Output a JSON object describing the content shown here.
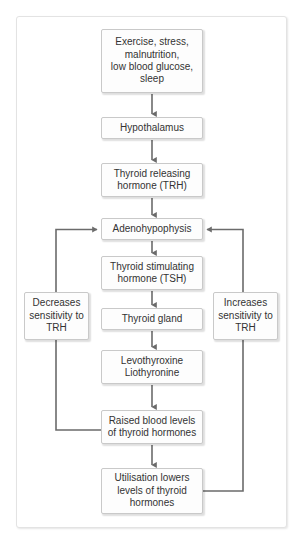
{
  "figure": {
    "colors": {
      "page_background": "#ffffff",
      "frame_border": "#e3e3e3",
      "box_fill": "#fdfdfd",
      "box_border": "#c9c9c9",
      "text": "#333333",
      "connector": "#6b6b6b"
    }
  },
  "nodes": {
    "stimuli": "Exercise, stress,\nmalnutrition,\nlow blood glucose,\nsleep",
    "hypothalamus": "Hypothalamus",
    "trh": "Thyroid releasing\nhormone (TRH)",
    "adenohypophysis": "Adenohypophysis",
    "tsh": "Thyroid stimulating\nhormone (TSH)",
    "thyroid_gland": "Thyroid gland",
    "levothyroxine": "Levothyroxine\nLiothyronine",
    "raised_levels": "Raised blood levels\nof thyroid hormones",
    "utilisation": "Utilisation lowers\nlevels of thyroid\nhormones",
    "decreases": "Decreases\nsensitivity to\nTRH",
    "increases": "Increases\nsensitivity to\nTRH"
  },
  "edges": [
    {
      "name": "stimuli-to-hypothalamus",
      "from": "stimuli",
      "to": "hypothalamus",
      "kind": "arrow-down"
    },
    {
      "name": "hypothalamus-to-trh",
      "from": "hypothalamus",
      "to": "trh",
      "kind": "arrow-down"
    },
    {
      "name": "trh-to-adenohypophysis",
      "from": "trh",
      "to": "adenohypophysis",
      "kind": "arrow-down"
    },
    {
      "name": "adenohypophysis-to-tsh",
      "from": "adenohypophysis",
      "to": "tsh",
      "kind": "arrow-down"
    },
    {
      "name": "tsh-to-thyroid-gland",
      "from": "tsh",
      "to": "thyroid_gland",
      "kind": "arrow-down"
    },
    {
      "name": "thyroid-gland-to-levothyroxine",
      "from": "thyroid_gland",
      "to": "levothyroxine",
      "kind": "arrow-down"
    },
    {
      "name": "levothyroxine-to-raised-levels",
      "from": "levothyroxine",
      "to": "raised_levels",
      "kind": "arrow-down"
    },
    {
      "name": "raised-levels-to-utilisation",
      "from": "raised_levels",
      "to": "utilisation",
      "kind": "arrow-down"
    },
    {
      "name": "raised-levels-feedback-left",
      "from": "raised_levels",
      "to": "adenohypophysis",
      "via": "decreases",
      "kind": "feedback-left-arrow-into-left-side"
    },
    {
      "name": "utilisation-feedback-right",
      "from": "utilisation",
      "to": "adenohypophysis",
      "via": "increases",
      "kind": "feedback-right-arrow-into-right-side"
    }
  ]
}
